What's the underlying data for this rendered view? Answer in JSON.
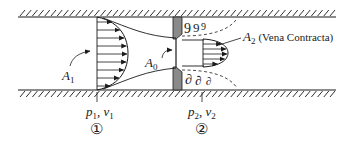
{
  "figure": {
    "labels": {
      "A1": {
        "main": "A",
        "sub": "1"
      },
      "A0": {
        "main": "A",
        "sub": "0"
      },
      "A2": {
        "main": "A",
        "sub": "2",
        "note": "(Vena Contracta)"
      },
      "station1": {
        "p": "p",
        "p_sub": "1",
        "sep": ", ",
        "v": "v",
        "v_sub": "1",
        "marker": "①"
      },
      "station2": {
        "p": "p",
        "p_sub": "2",
        "sep": ", ",
        "v": "v",
        "v_sub": "2",
        "marker": "②"
      }
    },
    "colors": {
      "line": "#1a1a1a",
      "plate_fill": "#8a8a8a",
      "background": "#ffffff"
    }
  }
}
